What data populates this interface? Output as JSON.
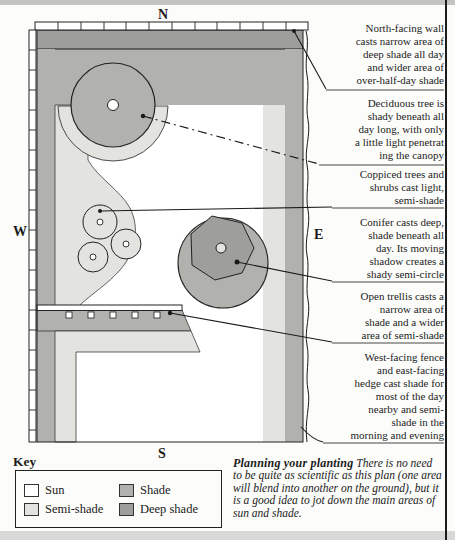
{
  "palette": {
    "page": "#fcfcfa",
    "sun": "#ffffff",
    "semi_shade": "#e3e3df",
    "shade": "#b1b1ad",
    "deep_shade": "#9e9e9a",
    "line": "#1a1a1a",
    "scan_bar": "#c4c4c2"
  },
  "compass": {
    "north": "N",
    "south": "S",
    "east": "E",
    "west": "W"
  },
  "annotations": [
    "North-facing wall\ncasts narrow area of\ndeep shade all day\nand wider area of\nover-half-day shade",
    "Deciduous tree is\nshady beneath all\nday long, with only\na little light penetrat\ning the canopy",
    "Coppiced trees and\nshrubs cast light,\nsemi-shade",
    "Conifer casts deep,\nshade beneath all\nday. Its moving\nshadow creates a\nshady semi-circle",
    "Open trellis casts a\nnarrow area of\nshade and a wider\narea of semi-shade",
    "West-facing fence\nand east-facing\nhedge cast shade for\nmost of the day\nnearby and semi-\nshade in the\nmorning and evening"
  ],
  "key": {
    "title": "Key",
    "items": [
      {
        "label": "Sun",
        "swatch": "sun"
      },
      {
        "label": "Semi-shade",
        "swatch": "semi_shade"
      },
      {
        "label": "Shade",
        "swatch": "shade"
      },
      {
        "label": "Deep shade",
        "swatch": "deep_shade"
      }
    ]
  },
  "caption": {
    "lead": "Planning your planting",
    "body": " There is no need to be quite as scientific as this plan (one area will blend into another on the ground), but it is a good idea to jot down the main areas of sun and shade."
  }
}
